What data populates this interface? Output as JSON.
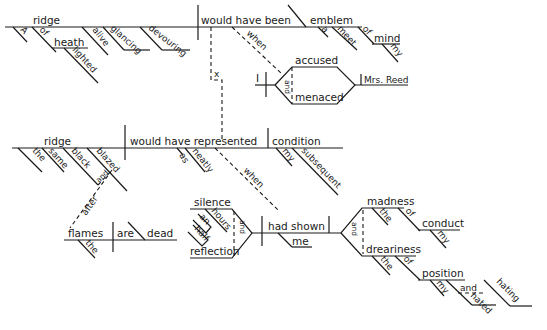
{
  "diagram": {
    "type": "sentence-diagram",
    "clause1": {
      "subject": "ridge",
      "subject_modifiers": [
        "A",
        "of",
        "heath",
        "lighted",
        "alive",
        "glancing",
        "devouring"
      ],
      "verb": "would have been",
      "complement": "emblem",
      "complement_modifiers": [
        "a",
        "meet",
        "of",
        "mind",
        "my"
      ],
      "connector": "x",
      "adverb_clause": {
        "conjunction": "when",
        "subject": "I",
        "verbs": [
          "accused",
          "menaced"
        ],
        "verb_conjunction": "and",
        "object": "Mrs. Reed"
      }
    },
    "clause2": {
      "subject": "ridge",
      "subject_modifiers": [
        "the",
        "same",
        "black",
        "blazed",
        "and"
      ],
      "verb": "would have represented",
      "verb_modifiers": [
        "as",
        "neatly"
      ],
      "object": "condition",
      "object_modifiers": [
        "my",
        "subsequent"
      ],
      "after_clause": {
        "conjunction": "after",
        "subject": "flames",
        "subject_modifiers": [
          "the"
        ],
        "verb": "are",
        "complement": "dead"
      },
      "when_clause": {
        "conjunction": "when",
        "subjects": [
          "silence",
          "reflection"
        ],
        "subject_conjunction": "and",
        "subject_modifiers": [
          "hours",
          "an",
          "half"
        ],
        "verb": "had shown",
        "indirect_object": "me",
        "objects": [
          "madness",
          "dreariness"
        ],
        "object_conjunction": "and",
        "madness_modifiers": [
          "the",
          "of",
          "conduct",
          "my"
        ],
        "dreariness_modifiers": [
          "the",
          "of",
          "position",
          "my",
          "and",
          "hated",
          "hating"
        ]
      }
    }
  }
}
